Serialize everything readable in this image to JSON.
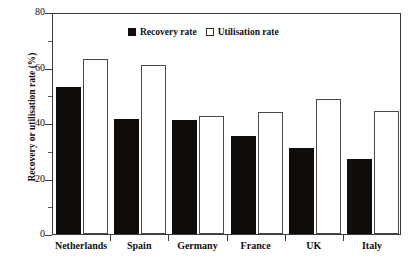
{
  "chart_data": {
    "type": "bar",
    "title": "",
    "subtitle": "",
    "xlabel": "",
    "ylabel": "Recovery or utilisation rate (%)",
    "categories": [
      "Netherlands",
      "Spain",
      "Germany",
      "France",
      "UK",
      "Italy"
    ],
    "series": [
      {
        "name": "Recovery rate",
        "values": [
          53,
          41.5,
          41,
          35.5,
          31,
          27
        ],
        "color": "#100c0a",
        "style": "filled"
      },
      {
        "name": "Utilisation rate",
        "values": [
          63,
          61,
          42.5,
          44,
          48.5,
          44.5
        ],
        "color": "#ffffff",
        "style": "hollow"
      }
    ],
    "ylim": [
      0,
      80
    ],
    "yticks": [
      0,
      20,
      40,
      60,
      80
    ],
    "ytick_labels": [
      "0",
      "20",
      "40",
      "60",
      "80"
    ],
    "yminor_ticks": [
      10,
      30,
      50,
      70
    ],
    "grid": false,
    "legend_position": "top-center",
    "legend": [
      "Recovery rate",
      "Utilisation rate"
    ]
  },
  "axis": {
    "y_title": "Recovery or utilisation rate (%)",
    "y_tick_0": "0",
    "y_tick_1": "20",
    "y_tick_2": "40",
    "y_tick_3": "60",
    "y_tick_4": "80"
  },
  "legend": {
    "recovery_label": "Recovery rate",
    "utilisation_label": "Utilisation rate"
  },
  "colors": {
    "recovery": "#100c0a",
    "utilisation": "#ffffff",
    "axis": "#3a3a3a",
    "background": "#ffffff"
  }
}
